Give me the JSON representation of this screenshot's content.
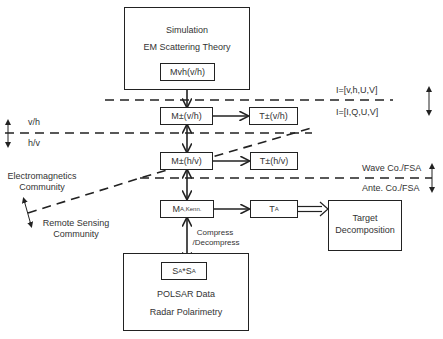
{
  "top_box": {
    "title": "Simulation",
    "subtitle": "EM Scattering Theory",
    "node": "Mvh(v/h)"
  },
  "bottom_box": {
    "node_main": "S",
    "node_sub": "A",
    "node_star": "*S",
    "node_sub2": "A",
    "title": "POLSAR Data",
    "subtitle": "Radar Polarimetry"
  },
  "nodes": {
    "m_vh": "M±(v/h)",
    "t_vh": "T±(v/h)",
    "m_hv": "M±(h/v)",
    "t_hv": "T±(h/v)",
    "m_a_main": "M",
    "m_a_sub": "A,Kenn.",
    "t_a_main": "T",
    "t_a_sub": "A",
    "target_decomposition_line1": "Target",
    "target_decomposition_line2": "Decomposition"
  },
  "boundary_labels": {
    "stokes_upper": "I=[v,h,U,V]",
    "stokes_lower": "I=[I,Q,U,V]",
    "basis_upper": "v/h",
    "basis_lower": "h/v",
    "wave_co": "Wave Co./FSA",
    "ante_co": "Ante. Co./FSA",
    "em_community_line1": "Electromagnetics",
    "em_community_line2": "Community",
    "rs_community_line1": "Remote Sensing",
    "rs_community_line2": "Community"
  },
  "edge_labels": {
    "compress_line1": "Compress",
    "compress_line2": "/Decompress"
  }
}
